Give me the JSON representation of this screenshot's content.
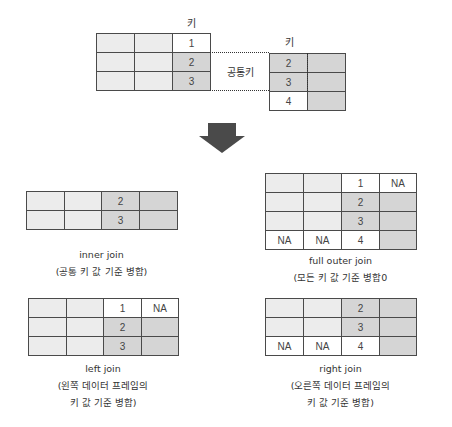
{
  "source": {
    "left_key_label": "키",
    "right_key_label": "키",
    "common_key_label": "공통키",
    "left_table": {
      "rows": [
        [
          {
            "v": "",
            "s": "light"
          },
          {
            "v": "",
            "s": "light"
          },
          {
            "v": "1",
            "s": "white"
          }
        ],
        [
          {
            "v": "",
            "s": "light"
          },
          {
            "v": "",
            "s": "light"
          },
          {
            "v": "2",
            "s": "dark"
          }
        ],
        [
          {
            "v": "",
            "s": "light"
          },
          {
            "v": "",
            "s": "light"
          },
          {
            "v": "3",
            "s": "dark"
          }
        ]
      ]
    },
    "right_table": {
      "rows": [
        [
          {
            "v": "2",
            "s": "dark"
          },
          {
            "v": "",
            "s": "dark"
          }
        ],
        [
          {
            "v": "3",
            "s": "dark"
          },
          {
            "v": "",
            "s": "dark"
          }
        ],
        [
          {
            "v": "4",
            "s": "white"
          },
          {
            "v": "",
            "s": "dark"
          }
        ]
      ]
    }
  },
  "arrow": {
    "icon": "down-arrow-icon",
    "color": "#4a4a4a"
  },
  "results": {
    "inner": {
      "title": "inner join",
      "caption": [
        "(공통 키 값 기준 병합)"
      ],
      "rows": [
        [
          {
            "v": "",
            "s": "light"
          },
          {
            "v": "",
            "s": "light"
          },
          {
            "v": "2",
            "s": "dark"
          },
          {
            "v": "",
            "s": "dark"
          }
        ],
        [
          {
            "v": "",
            "s": "light"
          },
          {
            "v": "",
            "s": "light"
          },
          {
            "v": "3",
            "s": "dark"
          },
          {
            "v": "",
            "s": "dark"
          }
        ]
      ]
    },
    "full_outer": {
      "title": "full outer join",
      "caption": [
        "(모든 키 값 기준 병합0"
      ],
      "rows": [
        [
          {
            "v": "",
            "s": "light"
          },
          {
            "v": "",
            "s": "light"
          },
          {
            "v": "1",
            "s": "white"
          },
          {
            "v": "NA",
            "s": "white"
          }
        ],
        [
          {
            "v": "",
            "s": "light"
          },
          {
            "v": "",
            "s": "light"
          },
          {
            "v": "2",
            "s": "dark"
          },
          {
            "v": "",
            "s": "dark"
          }
        ],
        [
          {
            "v": "",
            "s": "light"
          },
          {
            "v": "",
            "s": "light"
          },
          {
            "v": "3",
            "s": "dark"
          },
          {
            "v": "",
            "s": "dark"
          }
        ],
        [
          {
            "v": "NA",
            "s": "white"
          },
          {
            "v": "NA",
            "s": "white"
          },
          {
            "v": "4",
            "s": "white"
          },
          {
            "v": "",
            "s": "dark"
          }
        ]
      ]
    },
    "left": {
      "title": "left join",
      "caption": [
        "(왼쪽 데이터 프레임의",
        "키 값 기준 병합)"
      ],
      "rows": [
        [
          {
            "v": "",
            "s": "light"
          },
          {
            "v": "",
            "s": "light"
          },
          {
            "v": "1",
            "s": "white"
          },
          {
            "v": "NA",
            "s": "white"
          }
        ],
        [
          {
            "v": "",
            "s": "light"
          },
          {
            "v": "",
            "s": "light"
          },
          {
            "v": "2",
            "s": "dark"
          },
          {
            "v": "",
            "s": "dark"
          }
        ],
        [
          {
            "v": "",
            "s": "light"
          },
          {
            "v": "",
            "s": "light"
          },
          {
            "v": "3",
            "s": "dark"
          },
          {
            "v": "",
            "s": "dark"
          }
        ]
      ]
    },
    "right": {
      "title": "right join",
      "caption": [
        "(오른쪽 데이터 프레임의",
        "키 값 기준 병합)"
      ],
      "rows": [
        [
          {
            "v": "",
            "s": "light"
          },
          {
            "v": "",
            "s": "light"
          },
          {
            "v": "2",
            "s": "dark"
          },
          {
            "v": "",
            "s": "dark"
          }
        ],
        [
          {
            "v": "",
            "s": "light"
          },
          {
            "v": "",
            "s": "light"
          },
          {
            "v": "3",
            "s": "dark"
          },
          {
            "v": "",
            "s": "dark"
          }
        ],
        [
          {
            "v": "NA",
            "s": "white"
          },
          {
            "v": "NA",
            "s": "white"
          },
          {
            "v": "4",
            "s": "white"
          },
          {
            "v": "",
            "s": "dark"
          }
        ]
      ]
    }
  },
  "colors": {
    "light": "#ececec",
    "dark": "#d5d5d5",
    "white": "#ffffff",
    "border": "#4a4a4a"
  }
}
